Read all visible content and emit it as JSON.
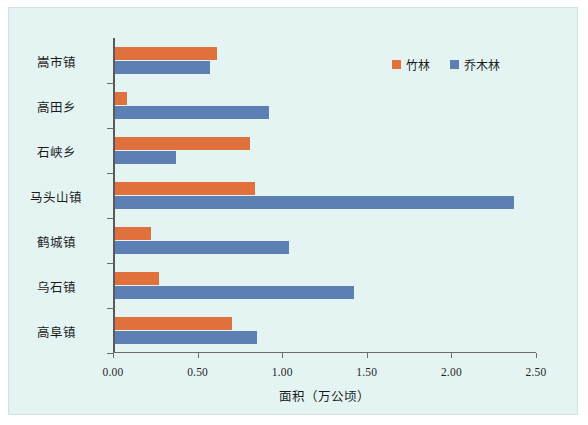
{
  "chart_data": {
    "type": "bar",
    "orientation": "horizontal",
    "title": "",
    "subtitle": "",
    "xlabel": "面积（万公顷）",
    "ylabel": "",
    "xlim": [
      0.0,
      2.5
    ],
    "xticks": [
      "0.00",
      "0.50",
      "1.00",
      "1.50",
      "2.00",
      "2.50"
    ],
    "xtick_values": [
      0.0,
      0.5,
      1.0,
      1.5,
      2.0,
      2.5
    ],
    "grid": false,
    "legend_position": "top-right",
    "categories": [
      "嵩市镇",
      "高田乡",
      "石峡乡",
      "马头山镇",
      "鹤城镇",
      "乌石镇",
      "高阜镇"
    ],
    "series": [
      {
        "name": "竹林",
        "color": "#e0703c",
        "values": [
          0.6,
          0.07,
          0.8,
          0.83,
          0.21,
          0.26,
          0.69
        ]
      },
      {
        "name": "乔木林",
        "color": "#5d80b4",
        "values": [
          0.56,
          0.91,
          0.36,
          2.36,
          1.03,
          1.41,
          0.84
        ]
      }
    ],
    "annotations": []
  },
  "figure": {
    "background_color": "#e3f4f2",
    "border_color": "#cfe3e1",
    "axis_color": "#6b6b6b"
  }
}
